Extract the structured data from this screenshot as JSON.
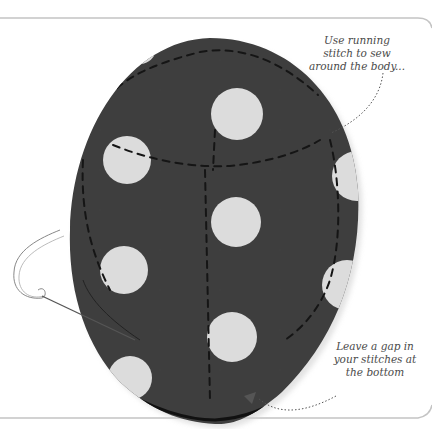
{
  "illustration": {
    "subject": "polka-dot fabric body being sewn with running stitch",
    "colors": {
      "fabric": "#3e3e3e",
      "dots": "#dcdcdc",
      "frame_line": "#bdbdbd",
      "stitch": "#1a1a1a",
      "thread": "#8a8a8a",
      "annotation_text": "#4a4a4a"
    }
  },
  "annotations": {
    "top": {
      "lines": [
        "Use running",
        "stitch to sew",
        "around the body..."
      ]
    },
    "bottom": {
      "lines": [
        "Leave a gap in",
        "your stitches at",
        "the bottom"
      ]
    }
  }
}
